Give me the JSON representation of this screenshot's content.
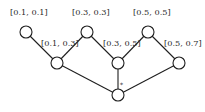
{
  "diagram": {
    "type": "lattice-graph",
    "nodes": [
      {
        "id": "n1",
        "label": "[0.1, 0.1]",
        "cx": 26,
        "cy": 32,
        "label_x": 10,
        "label_y": 15
      },
      {
        "id": "n2",
        "label": "[0.1, 0.3]",
        "cx": 57,
        "cy": 63,
        "label_x": 41,
        "label_y": 46
      },
      {
        "id": "n3",
        "label": "[0.3, 0.3]",
        "cx": 87,
        "cy": 32,
        "label_x": 72,
        "label_y": 15
      },
      {
        "id": "n4",
        "label": "[0.3, 0.5]",
        "cx": 118,
        "cy": 63,
        "label_x": 103,
        "label_y": 46
      },
      {
        "id": "n5",
        "label": "[0.5, 0.5]",
        "cx": 148,
        "cy": 32,
        "label_x": 133,
        "label_y": 15
      },
      {
        "id": "n6",
        "label": "[0.5, 0.7]",
        "cx": 179,
        "cy": 63,
        "label_x": 164,
        "label_y": 46
      },
      {
        "id": "n7",
        "label": "",
        "cx": 118,
        "cy": 95,
        "label_x": 0,
        "label_y": 0
      }
    ],
    "edges": [
      {
        "from": "n1",
        "to": "n2"
      },
      {
        "from": "n2",
        "to": "n3"
      },
      {
        "from": "n3",
        "to": "n4"
      },
      {
        "from": "n4",
        "to": "n5"
      },
      {
        "from": "n5",
        "to": "n6"
      },
      {
        "from": "n2",
        "to": "n7"
      },
      {
        "from": "n4",
        "to": "n7"
      },
      {
        "from": "n6",
        "to": "n7"
      }
    ],
    "annotations": [
      {
        "text": "*",
        "x": 120,
        "y": 87,
        "near_edge": "n4-n7"
      }
    ],
    "node_radius": 6,
    "colors": {
      "stroke": "#1e1e1e",
      "fill": "#ffffff",
      "text": "#2a2a2a"
    }
  }
}
